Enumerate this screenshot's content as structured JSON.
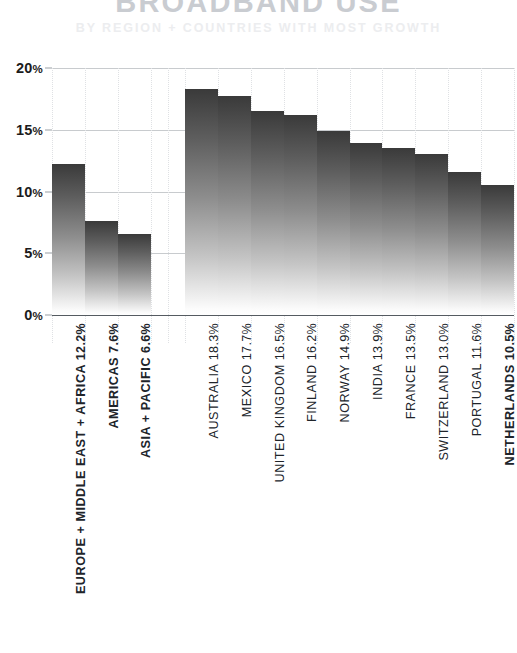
{
  "header": {
    "title": "BROADBAND USE",
    "subtitle": "BY REGION + COUNTRIES WITH MOST GROWTH"
  },
  "chart_data": {
    "type": "bar",
    "title": "BROADBAND USE",
    "subtitle": "BY REGION + COUNTRIES WITH MOST GROWTH",
    "xlabel": "",
    "ylabel": "",
    "ylim": [
      0,
      20
    ],
    "ytick_labels": [
      "20%",
      "15%",
      "10%",
      "5%",
      "0%"
    ],
    "ytick_values": [
      20,
      15,
      10,
      5,
      0
    ],
    "grid": true,
    "legend": false,
    "groups": [
      {
        "name": "regions",
        "bold_labels": true,
        "categories": [
          "EUROPE + MIDDLE EAST + AFRICA",
          "AMERICAS",
          "ASIA + PACIFIC"
        ],
        "values": [
          12.2,
          7.6,
          6.6
        ],
        "value_labels": [
          "12.2%",
          "7.6%",
          "6.6%"
        ]
      },
      {
        "name": "countries",
        "bold_labels": false,
        "categories": [
          "AUSTRALIA",
          "MEXICO",
          "UNITED KINGDOM",
          "FINLAND",
          "NORWAY",
          "INDIA",
          "FRANCE",
          "SWITZERLAND",
          "PORTUGAL",
          "NETHERLANDS"
        ],
        "values": [
          18.3,
          17.7,
          16.5,
          16.2,
          14.9,
          13.9,
          13.5,
          13.0,
          11.6,
          10.5
        ],
        "value_labels": [
          "18.3%",
          "17.7%",
          "16.5%",
          "16.2%",
          "14.9%",
          "13.9%",
          "13.5%",
          "13.0%",
          "11.6%",
          "10.5%"
        ]
      }
    ],
    "bars": [
      {
        "label": "EUROPE + MIDDLE EAST + AFRICA",
        "value_label": "12.2%",
        "value": 12.2,
        "group": "regions",
        "bold": true
      },
      {
        "label": "AMERICAS",
        "value_label": "7.6%",
        "value": 7.6,
        "group": "regions",
        "bold": true
      },
      {
        "label": "ASIA + PACIFIC",
        "value_label": "6.6%",
        "value": 6.6,
        "group": "regions",
        "bold": true
      },
      {
        "label": "AUSTRALIA",
        "value_label": "18.3%",
        "value": 18.3,
        "group": "countries",
        "bold": false
      },
      {
        "label": "MEXICO",
        "value_label": "17.7%",
        "value": 17.7,
        "group": "countries",
        "bold": false
      },
      {
        "label": "UNITED KINGDOM",
        "value_label": "16.5%",
        "value": 16.5,
        "group": "countries",
        "bold": false
      },
      {
        "label": "FINLAND",
        "value_label": "16.2%",
        "value": 16.2,
        "group": "countries",
        "bold": false
      },
      {
        "label": "NORWAY",
        "value_label": "14.9%",
        "value": 14.9,
        "group": "countries",
        "bold": false
      },
      {
        "label": "INDIA",
        "value_label": "13.9%",
        "value": 13.9,
        "group": "countries",
        "bold": false
      },
      {
        "label": "FRANCE",
        "value_label": "13.5%",
        "value": 13.5,
        "group": "countries",
        "bold": false
      },
      {
        "label": "SWITZERLAND",
        "value_label": "13.0%",
        "value": 13.0,
        "group": "countries",
        "bold": false
      },
      {
        "label": "PORTUGAL",
        "value_label": "11.6%",
        "value": 11.6,
        "group": "countries",
        "bold": false
      },
      {
        "label": "NETHERLANDS",
        "value_label": "10.5%",
        "value": 10.5,
        "group": "countries",
        "bold": true
      }
    ],
    "colors": {
      "bar_top": "#3a3a3a",
      "bar_bottom": "#ffffff",
      "gridline": "#9aa0a6",
      "baseline": "#555b61",
      "title": "#c9ccd1",
      "subtitle": "#ecedef",
      "label": "#20242a"
    }
  }
}
